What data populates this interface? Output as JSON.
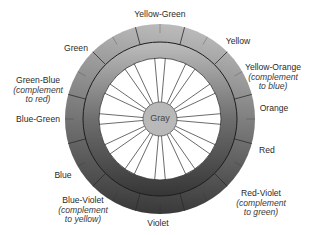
{
  "diagram": {
    "type": "color-wheel",
    "center_label": "Gray",
    "colors": {
      "outer_ring_light": "#c9c9c9",
      "outer_ring_dark": "#444444",
      "mid_ring_light": "#b4b4b4",
      "mid_ring_dark": "#3a3a3a",
      "inner_disc": "#ffffff",
      "center_fill": "#b9b9b9",
      "line": "#2b2b2b"
    },
    "labels": [
      {
        "id": "yellow-green",
        "name": "Yellow-Green",
        "note": ""
      },
      {
        "id": "yellow",
        "name": "Yellow",
        "note": ""
      },
      {
        "id": "yellow-orange",
        "name": "Yellow-Orange",
        "note": "(complement to blue)",
        "note_line1": "(complement",
        "note_line2": "to blue)"
      },
      {
        "id": "orange",
        "name": "Orange",
        "note": ""
      },
      {
        "id": "red",
        "name": "Red",
        "note": ""
      },
      {
        "id": "red-violet",
        "name": "Red-Violet",
        "note": "(complement to green)",
        "note_line1": "(complement",
        "note_line2": "to green)"
      },
      {
        "id": "violet",
        "name": "Violet",
        "note": ""
      },
      {
        "id": "blue-violet",
        "name": "Blue-Violet",
        "note": "(complement to yellow)",
        "note_line1": "(complement",
        "note_line2": "to yellow)"
      },
      {
        "id": "blue",
        "name": "Blue",
        "note": ""
      },
      {
        "id": "blue-green",
        "name": "Blue-Green",
        "note": ""
      },
      {
        "id": "green-blue",
        "name": "Green-Blue",
        "note": "(complement to red)",
        "note_line1": "(complement",
        "note_line2": "to red)"
      },
      {
        "id": "green",
        "name": "Green",
        "note": ""
      }
    ]
  }
}
